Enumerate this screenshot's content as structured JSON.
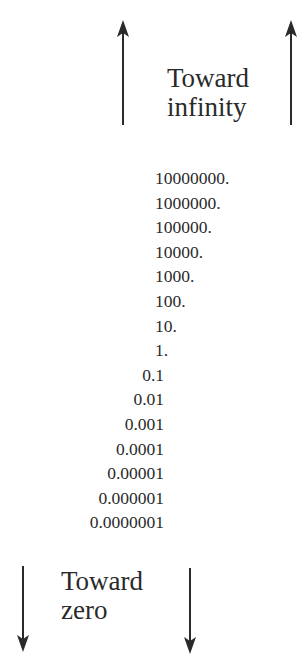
{
  "top_label": {
    "line1": "Toward",
    "line2": "infinity"
  },
  "bottom_label": {
    "line1": "Toward",
    "line2": "zero"
  },
  "icons": {
    "top_left": "arrow-up-icon",
    "top_right": "arrow-up-icon",
    "bottom_left": "arrow-down-icon",
    "bottom_right": "arrow-down-icon"
  },
  "numbers": [
    "10000000.",
    "1000000.",
    "100000.",
    "10000.",
    "1000.",
    "100.",
    "10.",
    "1.",
    "0.1",
    "0.01",
    "0.001",
    "0.0001",
    "0.00001",
    "0.000001",
    "0.0000001"
  ]
}
